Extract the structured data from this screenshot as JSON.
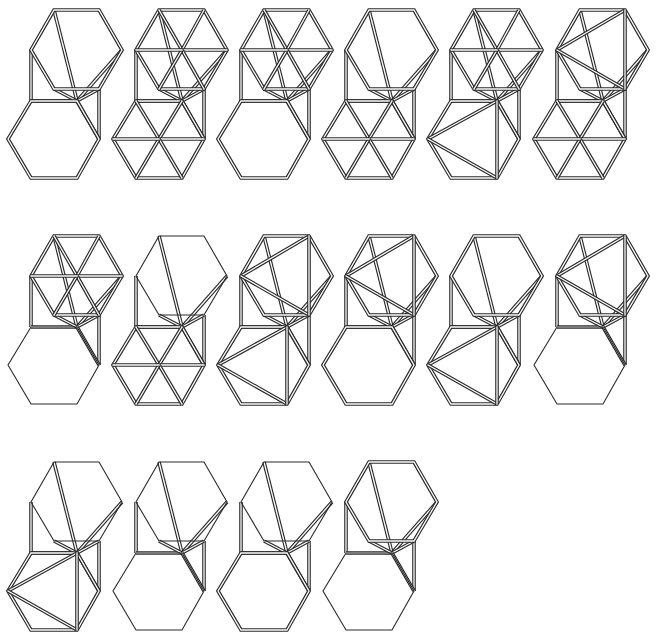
{
  "diagram": {
    "colors": {
      "stroke": "#2a2a2a",
      "background": "#ffffff"
    },
    "local_points": {
      "tTL": [
        54,
        10
      ],
      "tTR": [
        99,
        10
      ],
      "tR": [
        122,
        50
      ],
      "tBR": [
        99,
        89
      ],
      "tBL": [
        54,
        89
      ],
      "tL": [
        31,
        50
      ],
      "tC": [
        77,
        50
      ],
      "bTL": [
        31,
        101
      ],
      "bTR": [
        77,
        101
      ],
      "bR": [
        99,
        139
      ],
      "bBR": [
        77,
        178
      ],
      "bBL": [
        31,
        178
      ],
      "bL": [
        8,
        139
      ],
      "bC": [
        54,
        139
      ]
    },
    "figures": [
      {
        "id": 1,
        "row": 1,
        "col": 1,
        "x": 0,
        "y": 0,
        "top": "plain",
        "topStyle": "double",
        "bottom": "plain",
        "bottomStyle": "double",
        "link": "double"
      },
      {
        "id": 2,
        "row": 1,
        "col": 2,
        "x": 105,
        "y": 0,
        "top": "full",
        "topStyle": "double",
        "bottom": "full",
        "bottomStyle": "double",
        "link": "double"
      },
      {
        "id": 3,
        "row": 1,
        "col": 3,
        "x": 210,
        "y": 0,
        "top": "full",
        "topStyle": "double",
        "bottom": "plain",
        "bottomStyle": "double",
        "link": "double"
      },
      {
        "id": 4,
        "row": 1,
        "col": 4,
        "x": 315,
        "y": 0,
        "top": "plain",
        "topStyle": "double",
        "bottom": "full",
        "bottomStyle": "double",
        "link": "double"
      },
      {
        "id": 5,
        "row": 1,
        "col": 5,
        "x": 420,
        "y": 0,
        "top": "full",
        "topStyle": "double",
        "bottom": "fan",
        "bottomStyle": "double",
        "link": "double"
      },
      {
        "id": 6,
        "row": 1,
        "col": 6,
        "x": 526,
        "y": 0,
        "top": "wedge",
        "topStyle": "double",
        "bottom": "full",
        "bottomStyle": "double",
        "link": "double"
      },
      {
        "id": 7,
        "row": 2,
        "col": 1,
        "x": 0,
        "y": 226,
        "top": "full",
        "topStyle": "double",
        "bottom": "plain",
        "bottomStyle": "single",
        "link": "double"
      },
      {
        "id": 8,
        "row": 2,
        "col": 2,
        "x": 105,
        "y": 226,
        "top": "plain",
        "topStyle": "single",
        "bottom": "full",
        "bottomStyle": "double",
        "link": "double"
      },
      {
        "id": 9,
        "row": 2,
        "col": 3,
        "x": 210,
        "y": 226,
        "top": "wedge",
        "topStyle": "double",
        "bottom": "fan",
        "bottomStyle": "double",
        "link": "double"
      },
      {
        "id": 10,
        "row": 2,
        "col": 4,
        "x": 315,
        "y": 226,
        "top": "wedge",
        "topStyle": "double",
        "bottom": "plain",
        "bottomStyle": "double",
        "link": "double"
      },
      {
        "id": 11,
        "row": 2,
        "col": 5,
        "x": 420,
        "y": 226,
        "top": "plain",
        "topStyle": "double",
        "bottom": "fan",
        "bottomStyle": "double",
        "link": "double"
      },
      {
        "id": 12,
        "row": 2,
        "col": 6,
        "x": 526,
        "y": 226,
        "top": "wedge",
        "topStyle": "double",
        "bottom": "plain",
        "bottomStyle": "single",
        "link": "double"
      },
      {
        "id": 13,
        "row": 3,
        "col": 1,
        "x": 0,
        "y": 452,
        "top": "plain",
        "topStyle": "single",
        "bottom": "fan",
        "bottomStyle": "double",
        "link": "double"
      },
      {
        "id": 14,
        "row": 3,
        "col": 2,
        "x": 105,
        "y": 452,
        "top": "plain",
        "topStyle": "single",
        "bottom": "plain",
        "bottomStyle": "single",
        "link": "double"
      },
      {
        "id": 15,
        "row": 3,
        "col": 3,
        "x": 210,
        "y": 452,
        "top": "plain",
        "topStyle": "single",
        "bottom": "plain",
        "bottomStyle": "double",
        "link": "double"
      },
      {
        "id": 16,
        "row": 3,
        "col": 4,
        "x": 315,
        "y": 452,
        "top": "plain",
        "topStyle": "double",
        "bottom": "plain",
        "bottomStyle": "single",
        "link": "double"
      }
    ]
  }
}
